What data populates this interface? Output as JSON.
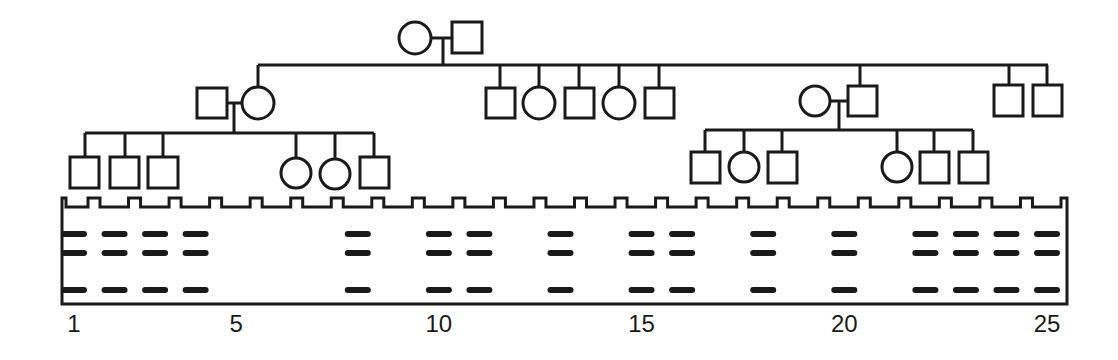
{
  "diagram": {
    "type": "pedigree_with_gel",
    "stroke_color": "#1a1a1a",
    "band_color": "#1a1a1a",
    "background": "#ffffff"
  },
  "pedigree": {
    "generation_1": {
      "couple": [
        {
          "id": "I-1",
          "sex": "female",
          "symbol": "circle"
        },
        {
          "id": "I-2",
          "sex": "male",
          "symbol": "square"
        }
      ]
    },
    "generation_2": [
      {
        "id": "II-1",
        "sex": "male",
        "symbol": "square",
        "note": "married-in spouse"
      },
      {
        "id": "II-2",
        "sex": "female",
        "symbol": "circle",
        "child_of": "I"
      },
      {
        "id": "II-3",
        "sex": "male",
        "symbol": "square",
        "child_of": "I"
      },
      {
        "id": "II-4",
        "sex": "female",
        "symbol": "circle",
        "child_of": "I"
      },
      {
        "id": "II-5",
        "sex": "male",
        "symbol": "square",
        "child_of": "I"
      },
      {
        "id": "II-6",
        "sex": "female",
        "symbol": "circle",
        "child_of": "I"
      },
      {
        "id": "II-7",
        "sex": "male",
        "symbol": "square",
        "child_of": "I"
      },
      {
        "id": "II-8",
        "sex": "female",
        "symbol": "circle",
        "note": "married-in spouse"
      },
      {
        "id": "II-9",
        "sex": "male",
        "symbol": "square",
        "child_of": "I"
      },
      {
        "id": "II-10",
        "sex": "male",
        "symbol": "square",
        "child_of": "I"
      },
      {
        "id": "II-11",
        "sex": "male",
        "symbol": "square",
        "child_of": "I"
      }
    ],
    "generation_3": {
      "left_family": [
        {
          "id": "III-1",
          "sex": "male",
          "symbol": "square"
        },
        {
          "id": "III-2",
          "sex": "male",
          "symbol": "square"
        },
        {
          "id": "III-3",
          "sex": "male",
          "symbol": "square"
        },
        {
          "id": "III-4",
          "sex": "female",
          "symbol": "circle"
        },
        {
          "id": "III-5",
          "sex": "female",
          "symbol": "circle"
        },
        {
          "id": "III-6",
          "sex": "male",
          "symbol": "square"
        }
      ],
      "right_family": [
        {
          "id": "III-7",
          "sex": "male",
          "symbol": "square"
        },
        {
          "id": "III-8",
          "sex": "female",
          "symbol": "circle"
        },
        {
          "id": "III-9",
          "sex": "male",
          "symbol": "square"
        },
        {
          "id": "III-10",
          "sex": "female",
          "symbol": "circle"
        },
        {
          "id": "III-11",
          "sex": "male",
          "symbol": "square"
        },
        {
          "id": "III-12",
          "sex": "male",
          "symbol": "square"
        }
      ]
    }
  },
  "gel": {
    "lane_count": 25,
    "lane_labels": [
      {
        "lane": 1,
        "text": "1"
      },
      {
        "lane": 5,
        "text": "5"
      },
      {
        "lane": 10,
        "text": "10"
      },
      {
        "lane": 15,
        "text": "15"
      },
      {
        "lane": 20,
        "text": "20"
      },
      {
        "lane": 25,
        "text": "25"
      }
    ],
    "band_rows": [
      "upper",
      "middle",
      "lower"
    ],
    "lanes_with_bands": [
      1,
      2,
      3,
      4,
      8,
      10,
      11,
      13,
      15,
      16,
      18,
      20,
      22,
      23,
      24,
      25
    ],
    "lanes_without_bands": [
      5,
      6,
      7,
      9,
      12,
      14,
      17,
      19,
      21
    ],
    "bands_per_occupied_lane": [
      "upper",
      "middle",
      "lower"
    ]
  }
}
